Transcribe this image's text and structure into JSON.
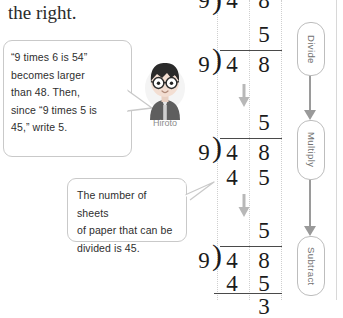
{
  "heading": "the right.",
  "bubbles": [
    {
      "id": "hiroto-bubble",
      "lines": [
        "“9 times 6 is 54”",
        "becomes larger",
        "than 48. Then,",
        "since “9 times 5 is",
        "45,”  write 5."
      ]
    },
    {
      "id": "sheets-bubble",
      "lines": [
        "The number of sheets",
        "of paper that can be",
        "divided is 45."
      ]
    }
  ],
  "character": {
    "name": "Hiroto",
    "hair_color": "#2b2b2b",
    "skin_color": "#f3ded2",
    "shirt_color": "#5e5e5e"
  },
  "division_steps": [
    {
      "label": "step-0-partial",
      "divisor": "9",
      "quotient": [
        "",
        ""
      ],
      "dividend": [
        "4",
        "8"
      ],
      "product": [
        "",
        ""
      ],
      "remainder": ""
    },
    {
      "label": "step-1-divide",
      "divisor": "9",
      "quotient": [
        "",
        "5"
      ],
      "dividend": [
        "4",
        "8"
      ],
      "product": [
        "",
        ""
      ],
      "remainder": ""
    },
    {
      "label": "step-2-multiply",
      "divisor": "9",
      "quotient": [
        "",
        "5"
      ],
      "dividend": [
        "4",
        "8"
      ],
      "product": [
        "4",
        "5"
      ],
      "remainder": ""
    },
    {
      "label": "step-3-subtract",
      "divisor": "9",
      "quotient": [
        "",
        "5"
      ],
      "dividend": [
        "4",
        "8"
      ],
      "product": [
        "4",
        "5"
      ],
      "remainder": "3"
    }
  ],
  "steps_column": [
    {
      "label": "Divide"
    },
    {
      "label": "Multiply"
    },
    {
      "label": "Subtract"
    }
  ],
  "colors": {
    "ink": "#1b1b1b",
    "rule": "#4a4a4a",
    "guide": "#cfcfcf",
    "arrow": "#9a9a9a",
    "bubble_border": "#c9c9c9"
  }
}
